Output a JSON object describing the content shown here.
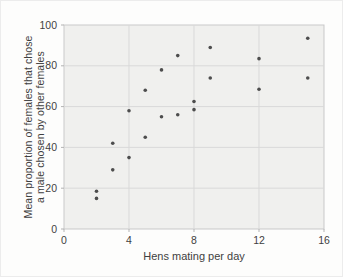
{
  "figure": {
    "xlabel": "Hens mating per day",
    "ylabel_line1": "Mean proportion of females that chose",
    "ylabel_line2": "a male chosen by other females"
  },
  "chart_data": {
    "type": "scatter",
    "title": "",
    "xlabel": "Hens mating per day",
    "ylabel": "Mean proportion of females that chose a male chosen by other females",
    "xlim": [
      0,
      16
    ],
    "ylim": [
      0,
      100
    ],
    "x_ticks": [
      0,
      4,
      8,
      12,
      16
    ],
    "y_ticks": [
      0,
      20,
      40,
      60,
      80,
      100
    ],
    "grid": true,
    "legend": "none",
    "points": [
      {
        "x": 2,
        "y": 15
      },
      {
        "x": 2,
        "y": 18.5
      },
      {
        "x": 3,
        "y": 29
      },
      {
        "x": 3,
        "y": 42
      },
      {
        "x": 4,
        "y": 35
      },
      {
        "x": 4,
        "y": 58
      },
      {
        "x": 5,
        "y": 45
      },
      {
        "x": 5,
        "y": 68
      },
      {
        "x": 6,
        "y": 55
      },
      {
        "x": 6,
        "y": 78
      },
      {
        "x": 7,
        "y": 56
      },
      {
        "x": 7,
        "y": 85
      },
      {
        "x": 8,
        "y": 58.5
      },
      {
        "x": 8,
        "y": 62.5
      },
      {
        "x": 9,
        "y": 74
      },
      {
        "x": 9,
        "y": 89
      },
      {
        "x": 12,
        "y": 68.5
      },
      {
        "x": 12,
        "y": 83.5
      },
      {
        "x": 15,
        "y": 74
      },
      {
        "x": 15,
        "y": 93.5
      }
    ],
    "colors": {
      "point": "#4d4d4d",
      "plot_bg": "#f0f0ee",
      "gridline": "#d9d9d9",
      "border": "#c9c9c9",
      "tick": "#b3b3b3",
      "text": "#3f3f3f",
      "page_bg": "#fdfdfc"
    }
  }
}
